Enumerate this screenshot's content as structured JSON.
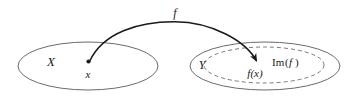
{
  "figure": {
    "type": "set-mapping-diagram",
    "background_color": "#ffffff",
    "stroke_color": "#555555",
    "arrow_color": "#1a1a1a",
    "text_color": "#1a1a1a",
    "labels": {
      "function_label": "f",
      "domain_label": "X",
      "element_label": "x",
      "codomain_label": "Y",
      "image_element_label": "f(x)",
      "image_set_label_prefix": "Im",
      "image_set_label_open": "(",
      "image_set_label_arg": "f",
      "image_set_label_close": ")",
      "image_set_label_full": "Im(f)"
    },
    "shapes": {
      "domain_ellipse": {
        "cx": 88,
        "cy": 66,
        "rx": 70,
        "ry": 24,
        "style": "solid"
      },
      "codomain_ellipse": {
        "cx": 265,
        "cy": 66,
        "rx": 75,
        "ry": 24,
        "style": "solid"
      },
      "image_ellipse": {
        "cx": 264,
        "cy": 65,
        "rx": 60,
        "ry": 18,
        "style": "dashed"
      },
      "domain_point": {
        "cx": 88,
        "cy": 62,
        "r": 2
      },
      "arrow": {
        "start_x": 89,
        "start_y": 61,
        "apex_x": 175,
        "apex_y": 22,
        "end_x": 259,
        "end_y": 64
      }
    }
  }
}
